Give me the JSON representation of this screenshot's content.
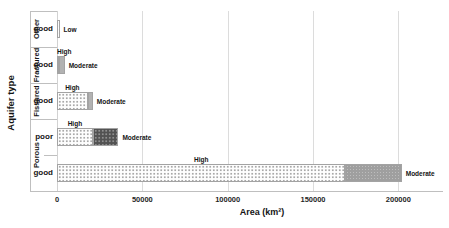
{
  "chart_data": {
    "type": "bar",
    "orientation": "horizontal",
    "title": "",
    "xlabel": "Area (km²)",
    "ylabel": "Aquifer type",
    "x_ticks": [
      "0",
      "50000",
      "100000",
      "150000",
      "200000"
    ],
    "x_tick_values": [
      0,
      50000,
      100000,
      150000,
      200000
    ],
    "xlim": [
      0,
      225000
    ],
    "grid": true,
    "legend": "none (segments labeled directly: High / Moderate / Low)",
    "rows": [
      {
        "group": "Other",
        "sub": "good",
        "segments": [
          {
            "label": "Low",
            "value": 1500,
            "pattern": "dots-light",
            "label_pos": "right"
          }
        ]
      },
      {
        "group": "Fractured",
        "sub": "good",
        "segments": [
          {
            "label": "High",
            "value": 1000,
            "pattern": "dots-light",
            "label_pos": "above"
          },
          {
            "label": "Moderate",
            "value": 3500,
            "pattern": "solid-gray",
            "label_pos": "right"
          }
        ]
      },
      {
        "group": "Fissured",
        "sub": "good",
        "segments": [
          {
            "label": "High",
            "value": 18000,
            "pattern": "dots-light",
            "label_pos": "above"
          },
          {
            "label": "Moderate",
            "value": 3000,
            "pattern": "solid-gray",
            "label_pos": "right"
          }
        ]
      },
      {
        "group": "Porous",
        "sub": "poor",
        "segments": [
          {
            "label": "High",
            "value": 21000,
            "pattern": "dots-light",
            "label_pos": "above"
          },
          {
            "label": "Moderate",
            "value": 15000,
            "pattern": "dots-dark",
            "label_pos": "right"
          }
        ]
      },
      {
        "group": "Porous",
        "sub": "good",
        "segments": [
          {
            "label": "High",
            "value": 169000,
            "pattern": "dots-light",
            "label_pos": "above"
          },
          {
            "label": "Moderate",
            "value": 33000,
            "pattern": "gray-medium",
            "label_pos": "right"
          }
        ]
      }
    ],
    "colors": {
      "gridline": "#dcdcdc",
      "axis_line": "#bfbfbf",
      "text": "#141414",
      "high_pattern_dot": "#a8a8a8",
      "moderate_solid": "#b2b2b2",
      "moderate_dark": "#525252",
      "moderate_medium": "#9f9f9f"
    }
  }
}
